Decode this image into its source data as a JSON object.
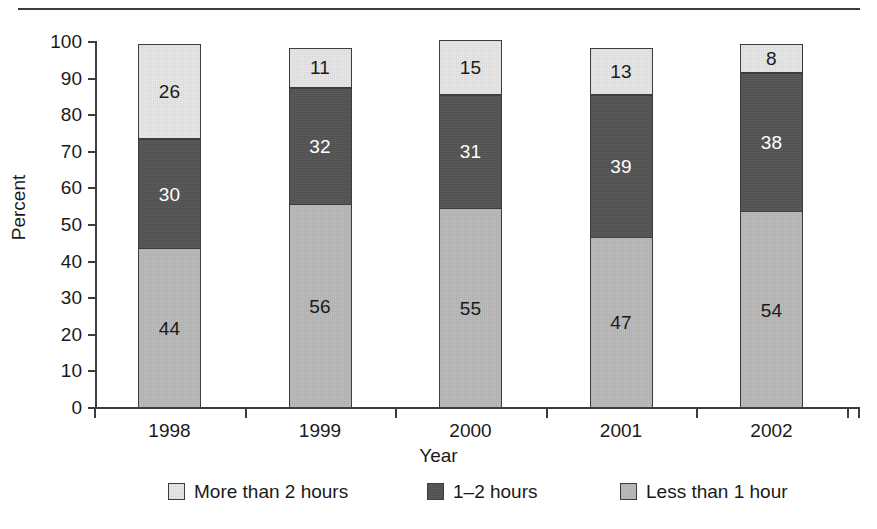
{
  "figure": {
    "top_rule": "horizontal-rule"
  },
  "axes": {
    "y_title": "Percent",
    "x_title": "Year",
    "y_ticks": [
      "100",
      "90",
      "80",
      "70",
      "60",
      "50",
      "40",
      "30",
      "20",
      "10",
      "0"
    ],
    "x_ticks": [
      "1998",
      "1999",
      "2000",
      "2001",
      "2002"
    ]
  },
  "legend": {
    "items": [
      {
        "label": "More than 2 hours",
        "swatch": "light-gray",
        "color": "#e9e9e9"
      },
      {
        "label": "1–2 hours",
        "swatch": "dark-gray",
        "color": "#535353"
      },
      {
        "label": "Less than 1 hour",
        "swatch": "mid-gray",
        "color": "#bebebe"
      }
    ]
  },
  "bars": [
    {
      "year": "1998",
      "segments": [
        {
          "label": "26",
          "value": 26,
          "series": "More than 2 hours"
        },
        {
          "label": "30",
          "value": 30,
          "series": "1–2 hours"
        },
        {
          "label": "44",
          "value": 44,
          "series": "Less than 1 hour"
        }
      ]
    },
    {
      "year": "1999",
      "segments": [
        {
          "label": "11",
          "value": 11,
          "series": "More than 2 hours"
        },
        {
          "label": "32",
          "value": 32,
          "series": "1–2 hours"
        },
        {
          "label": "56",
          "value": 56,
          "series": "Less than 1 hour"
        }
      ]
    },
    {
      "year": "2000",
      "segments": [
        {
          "label": "15",
          "value": 15,
          "series": "More than 2 hours"
        },
        {
          "label": "31",
          "value": 31,
          "series": "1–2 hours"
        },
        {
          "label": "55",
          "value": 55,
          "series": "Less than 1 hour"
        }
      ]
    },
    {
      "year": "2001",
      "segments": [
        {
          "label": "13",
          "value": 13,
          "series": "More than 2 hours"
        },
        {
          "label": "39",
          "value": 39,
          "series": "1–2 hours"
        },
        {
          "label": "47",
          "value": 47,
          "series": "Less than 1 hour"
        }
      ]
    },
    {
      "year": "2002",
      "segments": [
        {
          "label": "8",
          "value": 8,
          "series": "More than 2 hours"
        },
        {
          "label": "38",
          "value": 38,
          "series": "1–2 hours"
        },
        {
          "label": "54",
          "value": 54,
          "series": "Less than 1 hour"
        }
      ]
    }
  ],
  "chart_data": {
    "type": "bar",
    "stacked": true,
    "orientation": "vertical",
    "title": "",
    "subtitle": "",
    "xlabel": "Year",
    "ylabel": "Percent",
    "categories": [
      "1998",
      "1999",
      "2000",
      "2001",
      "2002"
    ],
    "series": [
      {
        "name": "Less than 1 hour",
        "values": [
          44,
          56,
          55,
          47,
          54
        ],
        "color": "#bebebe",
        "stack_position": "bottom"
      },
      {
        "name": "1–2 hours",
        "values": [
          30,
          32,
          31,
          39,
          38
        ],
        "color": "#535353",
        "stack_position": "middle"
      },
      {
        "name": "More than 2 hours",
        "values": [
          26,
          11,
          15,
          13,
          8
        ],
        "color": "#e9e9e9",
        "stack_position": "top"
      }
    ],
    "ylim": [
      0,
      100
    ],
    "ytick_step": 10,
    "yticks": [
      0,
      10,
      20,
      30,
      40,
      50,
      60,
      70,
      80,
      90,
      100
    ],
    "grid": false,
    "legend_position": "bottom",
    "data_labels": true,
    "totals": [
      100,
      99,
      101,
      99,
      100
    ],
    "annotations": []
  }
}
